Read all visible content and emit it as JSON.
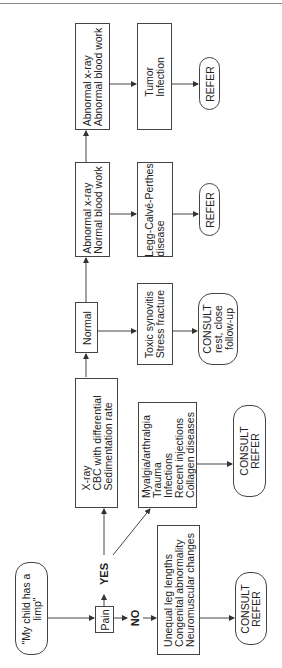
{
  "diagram": {
    "orientation": "rotated-90-ccw",
    "nodes": {
      "start": "\"My child has a\nlimp\"",
      "pain": "Pain",
      "xray_tests": "X-ray\nCBC with differential\nSedimentation rate",
      "normal": "Normal",
      "abn_xray_normal_blood": "Abnormal x-ray\nNormal blood work",
      "abn_xray_abn_blood": "Abnormal x-ray\nAbnormal blood work",
      "no_pain_causes": "Unequal leg lengths\nCongenital abnormality\nNeuromuscular changes",
      "pain_causes": "Myalgia/arthralgia\nTrauma\nInfections\nRecent injections\nCollagen diseases",
      "toxic": "Toxic synovitis\nStress fracture",
      "legg": "Legg-Calvé-Perthes\ndisease",
      "tumor": "Tumor\nInfection",
      "consult_refer_no": "CONSULT\nREFER",
      "consult_refer_pain": "CONSULT\nREFER",
      "consult_rest": "CONSULT\nrest, close\nfollow-up",
      "refer_legg": "REFER",
      "refer_tumor": "REFER"
    },
    "edge_labels": {
      "yes": "YES",
      "no": "NO"
    }
  }
}
